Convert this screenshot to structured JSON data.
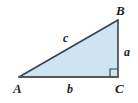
{
  "figure": {
    "kind": "right-triangle-diagram",
    "canvas": {
      "width": 138,
      "height": 103,
      "background": "#ffffff"
    },
    "colors": {
      "fill": "#cfe4f1",
      "stroke": "#3a4050",
      "base_stroke": "#54585f",
      "label": "#1d1d1f"
    },
    "vertices": [
      {
        "id": "A",
        "label": "A",
        "x": 19,
        "y": 77,
        "angle": "acute"
      },
      {
        "id": "B",
        "label": "B",
        "x": 118,
        "y": 20,
        "angle": "acute"
      },
      {
        "id": "C",
        "label": "C",
        "x": 118,
        "y": 77,
        "angle": "right"
      }
    ],
    "sides": [
      {
        "id": "a",
        "label": "a",
        "between": "B-C",
        "role": "opposite-leg"
      },
      {
        "id": "b",
        "label": "b",
        "between": "A-C",
        "role": "adjacent-leg"
      },
      {
        "id": "c",
        "label": "c",
        "between": "A-B",
        "role": "hypotenuse"
      }
    ],
    "right_angle_marker": {
      "at": "C",
      "size": 8
    }
  }
}
